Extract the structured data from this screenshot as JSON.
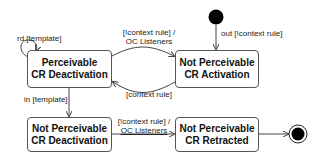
{
  "states": [
    {
      "id": "pcd",
      "line1": "Perceivable",
      "line2": "CR Deactivation"
    },
    {
      "id": "npca",
      "line1": "Not Perceivable",
      "line2": "CR Activation"
    },
    {
      "id": "npcd",
      "line1": "Not Perceivable",
      "line2": "CR Deactivation"
    },
    {
      "id": "npcr",
      "line1": "Not Perceivable",
      "line2": "CR Retracted"
    }
  ],
  "transitions": {
    "self_loop": "rd [template]",
    "initial": "out [!context rule]",
    "pcd_to_npca_1": "[!context rule]  /",
    "pcd_to_npca_2": "OC Listeners",
    "npca_to_pcd": "[context rule]",
    "pcd_to_npcd": "in [template]",
    "npcd_to_npcr_1": "[!context rule]  /",
    "npcd_to_npcr_2": "OC Listeners"
  }
}
